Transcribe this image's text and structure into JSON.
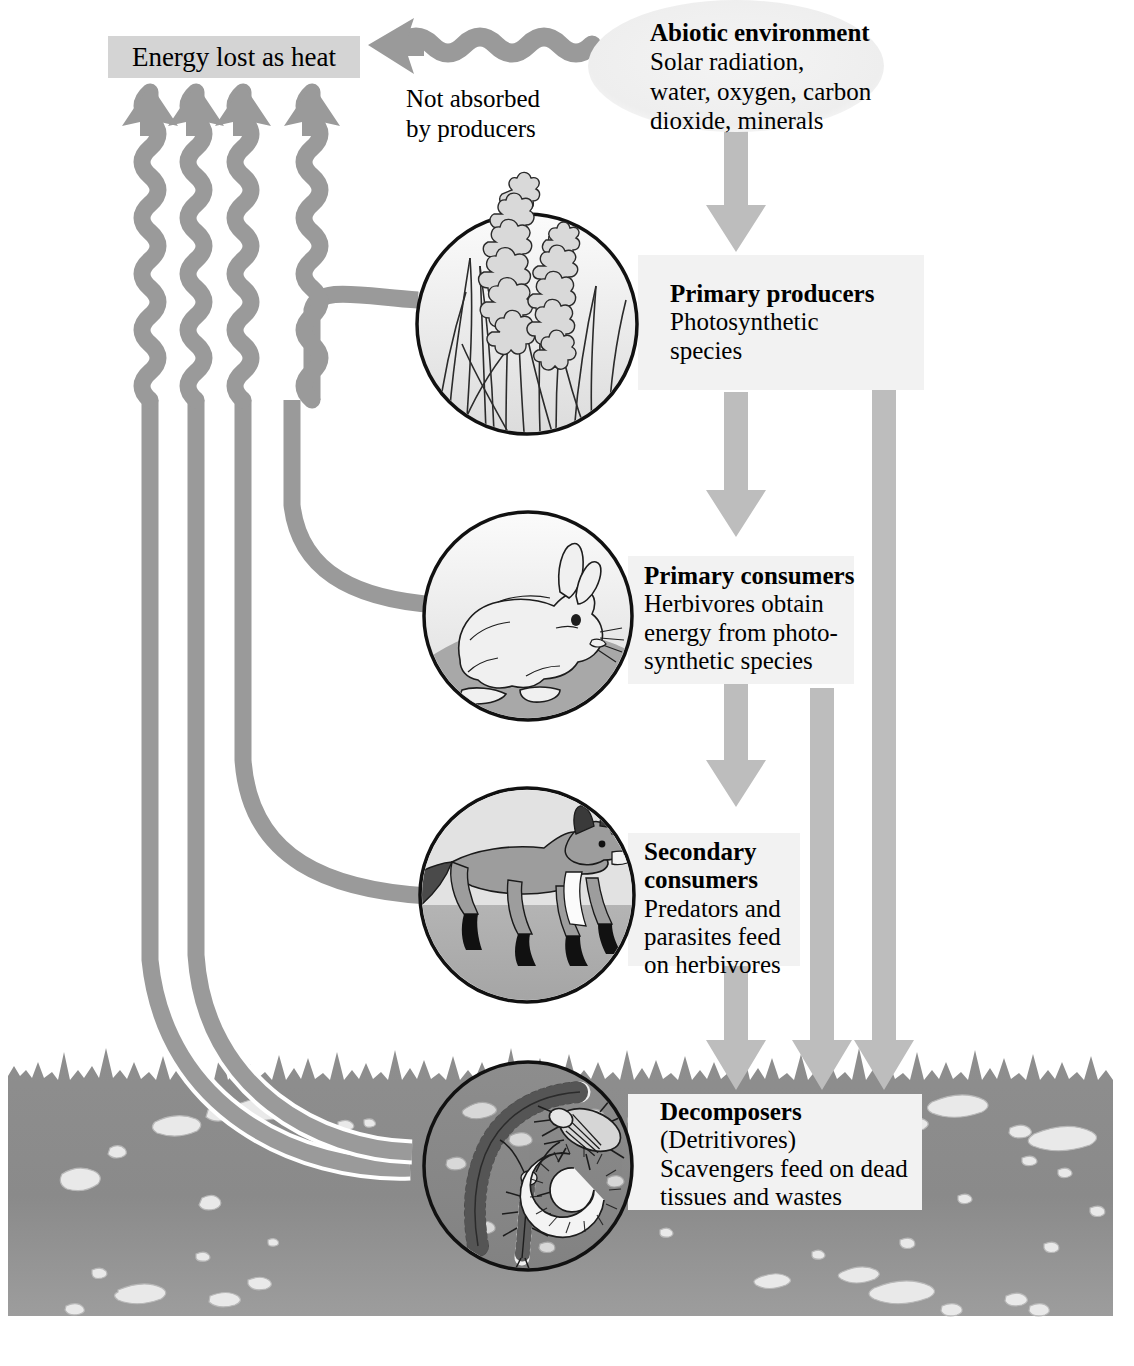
{
  "diagram": {
    "type": "energy-flow-diagram",
    "colors": {
      "arrow_gray": "#9a9a9a",
      "plate_gray": "#f2f2f2",
      "heatbox_gray": "#d4d4d4",
      "soil_gray": "#8f8f8f",
      "soil_dark": "#7d7d7d",
      "pebble_light": "#e8e8e8",
      "outline_black": "#111111",
      "ellipse_gray": "#efefef"
    }
  },
  "nodes": {
    "abiotic": {
      "title": "Abiotic environment",
      "line1": "Solar radiation,",
      "line2": "water, oxygen, carbon",
      "line3": "dioxide, minerals"
    },
    "heat": {
      "label": "Energy lost as heat"
    },
    "not_absorbed": {
      "line1": "Not absorbed",
      "line2": "by producers"
    },
    "producers": {
      "title": "Primary producers",
      "line1": "Photosynthetic",
      "line2": "species"
    },
    "primary_consumers": {
      "title": "Primary consumers",
      "line1": "Herbivores obtain",
      "line2": "energy from photo-",
      "line3": "synthetic species"
    },
    "secondary_consumers": {
      "title_line1": "Secondary",
      "title_line2": "consumers",
      "line1": "Predators and",
      "line2": "parasites feed",
      "line3": "on herbivores"
    },
    "decomposers": {
      "title": "Decomposers",
      "line1": "(Detritivores)",
      "line2": "Scavengers feed on dead",
      "line3": "tissues and wastes"
    }
  },
  "illustrations": [
    {
      "name": "grass-flowers-illustration",
      "subject": "grass with flower spikes",
      "node": "producers"
    },
    {
      "name": "rabbit-illustration",
      "subject": "rabbit",
      "node": "primary_consumers"
    },
    {
      "name": "fox-illustration",
      "subject": "fox",
      "node": "secondary_consumers"
    },
    {
      "name": "soil-invertebrates-illustration",
      "subject": "earthworm, beetle, insect larva, coiled millipede",
      "node": "decomposers"
    }
  ],
  "flows": [
    {
      "from": "abiotic",
      "to": "producers",
      "style": "straight-arrow"
    },
    {
      "from": "abiotic",
      "to": "heat",
      "style": "wavy-arrow",
      "annotation": "Not absorbed by producers"
    },
    {
      "from": "producers",
      "to": "primary_consumers",
      "style": "straight-arrow"
    },
    {
      "from": "primary_consumers",
      "to": "secondary_consumers",
      "style": "straight-arrow"
    },
    {
      "from": "secondary_consumers",
      "to": "decomposers",
      "style": "straight-arrow"
    },
    {
      "from": "producers",
      "to": "decomposers",
      "style": "straight-arrow"
    },
    {
      "from": "primary_consumers",
      "to": "decomposers",
      "style": "straight-arrow"
    },
    {
      "from": "producers",
      "to": "heat",
      "style": "wavy-arrow"
    },
    {
      "from": "primary_consumers",
      "to": "heat",
      "style": "wavy-arrow"
    },
    {
      "from": "secondary_consumers",
      "to": "heat",
      "style": "wavy-arrow"
    },
    {
      "from": "decomposers",
      "to": "heat",
      "style": "wavy-arrow"
    }
  ]
}
